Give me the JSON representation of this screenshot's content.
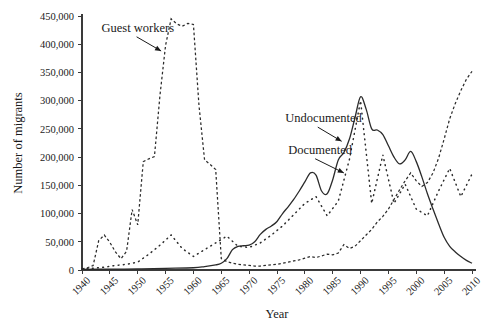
{
  "chart_data": {
    "type": "line",
    "title": "",
    "xlabel": "Year",
    "ylabel": "Number of migrants",
    "xlim": [
      1940,
      2010
    ],
    "ylim": [
      0,
      450000
    ],
    "grid": false,
    "legend_position": "inline-annotations",
    "xticks": [
      "1940",
      "1945",
      "1950",
      "1955",
      "1960",
      "1965",
      "1970",
      "1975",
      "1980",
      "1985",
      "1990",
      "1995",
      "2000",
      "2005",
      "2010"
    ],
    "yticks": [
      "0",
      "50,000",
      "100,000",
      "150,000",
      "200,000",
      "250,000",
      "300,000",
      "350,000",
      "400,000",
      "450,000"
    ],
    "annotations": [
      {
        "label": "Guest workers",
        "text_x": 1943.5,
        "text_y": 422000,
        "tip_x": 1954.2,
        "tip_y": 388000
      },
      {
        "label": "Undocumented",
        "text_x": 1976.5,
        "text_y": 262000,
        "tip_x": 1986.6,
        "tip_y": 228000
      },
      {
        "label": "Documented",
        "text_x": 1977.0,
        "text_y": 206000,
        "tip_x": 1987.0,
        "tip_y": 172000
      }
    ],
    "series": [
      {
        "name": "Guest workers",
        "style": "dashed",
        "x": [
          1940,
          1941,
          1942,
          1943,
          1944,
          1945,
          1946,
          1947,
          1948,
          1949,
          1950,
          1951,
          1952,
          1953,
          1954,
          1955,
          1956,
          1957,
          1958,
          1959,
          1960,
          1961,
          1962,
          1963,
          1964,
          1965,
          1966,
          1967,
          1968,
          1969,
          1970,
          1971,
          1972,
          1973,
          1974,
          1975,
          1976,
          1977,
          1978,
          1979,
          1980,
          1981,
          1982,
          1983,
          1984,
          1985,
          1986,
          1987,
          1988,
          1989,
          1990,
          1991,
          1992,
          1993,
          1994,
          1995,
          1996,
          1997,
          1998,
          1999,
          2000,
          2001,
          2002,
          2003,
          2004,
          2005,
          2006,
          2007,
          2008,
          2009,
          2010
        ],
        "values": [
          2000,
          4000,
          8000,
          52000,
          62000,
          49000,
          32000,
          20000,
          33000,
          107000,
          80000,
          192000,
          197000,
          201000,
          310000,
          398000,
          445000,
          436000,
          432000,
          437000,
          435000,
          291000,
          195000,
          187000,
          178000,
          20000,
          15000,
          12000,
          10000,
          9000,
          8000,
          7000,
          7000,
          8000,
          9000,
          10000,
          12000,
          14000,
          16000,
          18000,
          21000,
          24000,
          22000,
          25000,
          28000,
          27000,
          30000,
          45000,
          38000,
          42000,
          52000,
          62000,
          72000,
          85000,
          95000,
          108000,
          125000,
          142000,
          158000,
          172000,
          158000,
          148000,
          155000,
          172000,
          198000,
          232000,
          268000,
          295000,
          318000,
          338000,
          352000
        ]
      },
      {
        "name": "Documented",
        "style": "solid",
        "x": [
          1940,
          1945,
          1950,
          1955,
          1960,
          1962,
          1964,
          1965,
          1966,
          1967,
          1968,
          1969,
          1970,
          1971,
          1972,
          1973,
          1974,
          1975,
          1976,
          1977,
          1978,
          1979,
          1980,
          1981,
          1982,
          1983,
          1984,
          1985,
          1986,
          1987,
          1988,
          1989,
          1990,
          1991,
          1992,
          1993,
          1994,
          1995,
          1996,
          1997,
          1998,
          1999,
          2000,
          2001,
          2002,
          2003,
          2004,
          2005,
          2006,
          2007,
          2008,
          2009,
          2010
        ],
        "values": [
          1000,
          1500,
          2000,
          3000,
          4000,
          6000,
          9000,
          12000,
          20000,
          36000,
          42000,
          43000,
          44000,
          50000,
          63000,
          72000,
          78000,
          86000,
          100000,
          112000,
          125000,
          140000,
          156000,
          172000,
          168000,
          140000,
          135000,
          160000,
          195000,
          208000,
          232000,
          270000,
          307000,
          285000,
          250000,
          248000,
          240000,
          220000,
          200000,
          188000,
          195000,
          210000,
          192000,
          165000,
          135000,
          108000,
          82000,
          58000,
          42000,
          32000,
          24000,
          17000,
          12000
        ]
      },
      {
        "name": "Undocumented",
        "style": "dotted",
        "x": [
          1940,
          1942,
          1944,
          1946,
          1948,
          1950,
          1952,
          1954,
          1956,
          1958,
          1960,
          1962,
          1964,
          1966,
          1968,
          1970,
          1972,
          1974,
          1976,
          1978,
          1980,
          1982,
          1984,
          1986,
          1988,
          1990,
          1992,
          1994,
          1996,
          1998,
          2000,
          2002,
          2004,
          2006,
          2008,
          2010
        ],
        "values": [
          2000,
          3000,
          5000,
          8000,
          10000,
          14000,
          28000,
          44000,
          62000,
          38000,
          24000,
          36000,
          48000,
          60000,
          42000,
          40000,
          48000,
          62000,
          78000,
          98000,
          118000,
          130000,
          96000,
          122000,
          196000,
          300000,
          118000,
          204000,
          118000,
          152000,
          108000,
          96000,
          140000,
          180000,
          130000,
          170000
        ]
      }
    ]
  }
}
